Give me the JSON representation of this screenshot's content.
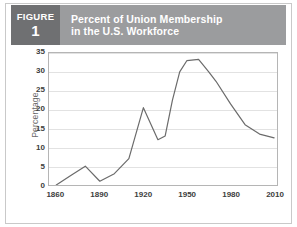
{
  "figure": {
    "label": "FIGURE",
    "number": "1",
    "box_color": "#6f7072",
    "title_bar_color": "#9b9c9e"
  },
  "title": {
    "line1": "Percent of Union Membership",
    "line2": "in the U.S. Workforce"
  },
  "chart_data": {
    "type": "line",
    "title": "Percent of Union Membership in the U.S. Workforce",
    "xlabel": "",
    "ylabel": "Percentage",
    "xlim": [
      1855,
      2012
    ],
    "ylim": [
      0,
      35
    ],
    "yticks": [
      0,
      5,
      10,
      15,
      20,
      25,
      30,
      35
    ],
    "ytick_labels": [
      "0",
      "5",
      "10",
      "15",
      "20",
      "25",
      "30",
      "35"
    ],
    "xticks": [
      1860,
      1890,
      1920,
      1950,
      1980,
      2010
    ],
    "xtick_labels": [
      "1860",
      "1890",
      "1920",
      "1950",
      "1980",
      "2010"
    ],
    "grid": "horizontal",
    "legend": "none",
    "line_color": "#6b6b6b",
    "grid_color": "#e2e2e2",
    "axis_color": "#b5b5b5",
    "series": [
      {
        "name": "Union membership",
        "x": [
          1860,
          1870,
          1880,
          1890,
          1900,
          1910,
          1920,
          1930,
          1935,
          1940,
          1945,
          1950,
          1958,
          1965,
          1970,
          1980,
          1990,
          2000,
          2010
        ],
        "values": [
          0.0,
          2.5,
          5.0,
          1.0,
          3.0,
          7.0,
          20.5,
          12.0,
          13.0,
          22.5,
          30.0,
          33.0,
          33.3,
          30.0,
          27.5,
          21.5,
          16.0,
          13.5,
          12.5
        ]
      }
    ]
  }
}
